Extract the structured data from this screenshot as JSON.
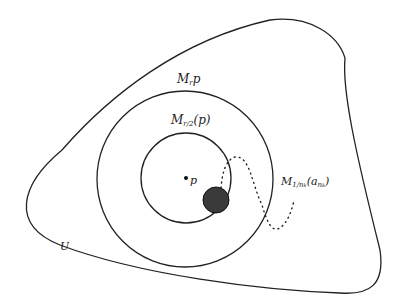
{
  "diagram": {
    "labels": {
      "outer_circle": "M",
      "outer_circle_sub": "r",
      "outer_circle_tail": "p",
      "inner_circle": "M",
      "inner_circle_sub": "r/2",
      "inner_circle_tail": "(p)",
      "point": "p",
      "path": "M",
      "path_sub": "1/n",
      "path_subsub": "k",
      "path_tail_open": "(a",
      "path_tail_sub": "n",
      "path_tail_subsub": "k",
      "path_tail_close": ")",
      "region": "U"
    },
    "colors": {
      "stroke": "#222222",
      "ball_fill": "#3a3a3a"
    }
  }
}
